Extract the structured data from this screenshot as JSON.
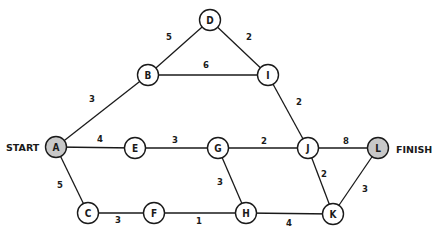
{
  "diagram": {
    "type": "weighted-undirected-graph",
    "start_label": "START",
    "finish_label": "FINISH",
    "colors": {
      "endpoint_fill": "#c8c8c8",
      "node_fill": "#ffffff",
      "stroke": "#1a1a1a"
    },
    "nodes": [
      {
        "id": "A",
        "label": "A",
        "x": 56,
        "y": 147,
        "endpoint": true
      },
      {
        "id": "B",
        "label": "B",
        "x": 148,
        "y": 75,
        "endpoint": false
      },
      {
        "id": "D",
        "label": "D",
        "x": 210,
        "y": 20,
        "endpoint": false
      },
      {
        "id": "I",
        "label": "I",
        "x": 268,
        "y": 75,
        "endpoint": false
      },
      {
        "id": "E",
        "label": "E",
        "x": 135,
        "y": 148,
        "endpoint": false
      },
      {
        "id": "G",
        "label": "G",
        "x": 218,
        "y": 148,
        "endpoint": false
      },
      {
        "id": "J",
        "label": "J",
        "x": 308,
        "y": 148,
        "endpoint": false
      },
      {
        "id": "L",
        "label": "L",
        "x": 378,
        "y": 148,
        "endpoint": true
      },
      {
        "id": "C",
        "label": "C",
        "x": 88,
        "y": 213,
        "endpoint": false
      },
      {
        "id": "F",
        "label": "F",
        "x": 154,
        "y": 213,
        "endpoint": false
      },
      {
        "id": "H",
        "label": "H",
        "x": 246,
        "y": 213,
        "endpoint": false
      },
      {
        "id": "K",
        "label": "K",
        "x": 333,
        "y": 214,
        "endpoint": false
      }
    ],
    "edges": [
      {
        "from": "A",
        "to": "B",
        "weight": "3",
        "lx": 92,
        "ly": 99
      },
      {
        "from": "B",
        "to": "D",
        "weight": "5",
        "lx": 169,
        "ly": 37
      },
      {
        "from": "D",
        "to": "I",
        "weight": "2",
        "lx": 249,
        "ly": 37
      },
      {
        "from": "B",
        "to": "I",
        "weight": "6",
        "lx": 206,
        "ly": 65
      },
      {
        "from": "I",
        "to": "J",
        "weight": "2",
        "lx": 299,
        "ly": 102
      },
      {
        "from": "A",
        "to": "E",
        "weight": "4",
        "lx": 100,
        "ly": 139
      },
      {
        "from": "E",
        "to": "G",
        "weight": "3",
        "lx": 175,
        "ly": 140
      },
      {
        "from": "G",
        "to": "J",
        "weight": "2",
        "lx": 264,
        "ly": 141
      },
      {
        "from": "J",
        "to": "L",
        "weight": "8",
        "lx": 346,
        "ly": 141
      },
      {
        "from": "A",
        "to": "C",
        "weight": "5",
        "lx": 60,
        "ly": 185
      },
      {
        "from": "C",
        "to": "F",
        "weight": "3",
        "lx": 118,
        "ly": 220
      },
      {
        "from": "F",
        "to": "H",
        "weight": "1",
        "lx": 199,
        "ly": 221
      },
      {
        "from": "G",
        "to": "H",
        "weight": "3",
        "lx": 220,
        "ly": 182
      },
      {
        "from": "H",
        "to": "K",
        "weight": "4",
        "lx": 289,
        "ly": 223
      },
      {
        "from": "J",
        "to": "K",
        "weight": "2",
        "lx": 324,
        "ly": 174
      },
      {
        "from": "L",
        "to": "K",
        "weight": "3",
        "lx": 365,
        "ly": 189
      }
    ]
  }
}
